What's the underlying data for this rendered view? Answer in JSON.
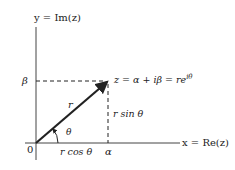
{
  "diagram": {
    "axes": {
      "x_label": "x = Re(z)",
      "y_label": "y = Im(z)",
      "origin_label": "0"
    },
    "point": {
      "label": "z = α + iβ = re",
      "exponent": "iθ"
    },
    "ticks": {
      "x_tick": "α",
      "y_tick": "β"
    },
    "labels": {
      "radius": "r",
      "angle": "θ",
      "vertical_component": "r sin θ",
      "horizontal_component": "r cos θ"
    },
    "colors": {
      "ink": "#222222",
      "axis": "#444444",
      "background": "#ffffff"
    }
  }
}
